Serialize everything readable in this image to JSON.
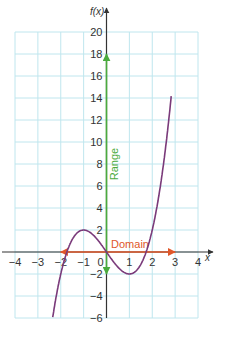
{
  "chart_data": {
    "type": "line",
    "title": "",
    "xlabel": "x",
    "ylabel": "f(x)",
    "xlim": [
      -4,
      4
    ],
    "ylim": [
      -6,
      20
    ],
    "grid": true,
    "x_ticks": [
      "-4",
      "-3",
      "-2",
      "-1",
      "0",
      "1",
      "2",
      "3",
      "4"
    ],
    "y_ticks": [
      "-6",
      "-4",
      "-2",
      "2",
      "4",
      "6",
      "8",
      "10",
      "12",
      "14",
      "16",
      "18",
      "20"
    ],
    "series": [
      {
        "name": "f(x) = x^3 - 3x",
        "color": "#7a3a7a",
        "x": [
          -2.6,
          -2,
          -1.5,
          -1,
          -0.5,
          0,
          0.5,
          1,
          1.5,
          2,
          2.5,
          3
        ],
        "y": [
          -9.78,
          -2,
          1.125,
          2,
          1.375,
          0,
          -1.375,
          -2,
          -1.125,
          2,
          8.125,
          18
        ]
      }
    ],
    "annotations": [
      {
        "label": "Domain",
        "type": "arrow",
        "color": "#e0572a",
        "from": [
          -2,
          0
        ],
        "to": [
          3,
          0
        ],
        "both_ends": true
      },
      {
        "label": "Range",
        "type": "arrow",
        "color": "#4aab3e",
        "from": [
          0,
          -2
        ],
        "to": [
          0,
          18
        ],
        "both_ends": true,
        "orientation": "vertical"
      }
    ],
    "colors": {
      "grid": "#bfe6ee",
      "axis": "#333333",
      "curve": "#7a3a7a",
      "domain": "#e0572a",
      "range": "#4aab3e"
    }
  }
}
